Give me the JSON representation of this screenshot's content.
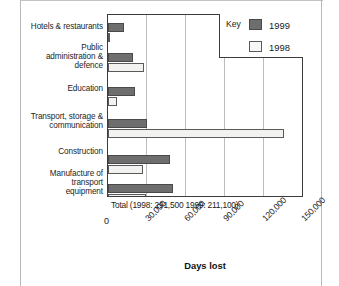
{
  "chart_data": {
    "type": "bar",
    "orientation": "horizontal",
    "title": "",
    "xlabel": "Days lost",
    "ylabel": "",
    "xlim": [
      0,
      150000
    ],
    "xticks": [
      0,
      30000,
      60000,
      90000,
      120000,
      150000
    ],
    "xtick_labels": [
      "0",
      "30,000",
      "60,000",
      "90,000",
      "120,000",
      "150,000"
    ],
    "grid": true,
    "legend_position": "top-right",
    "legend_title": "Key",
    "categories": [
      "Hotels & restaurants",
      "Public\nadministration &\ndefence",
      "Education",
      "Transport, storage &\ncommunication",
      "Construction",
      "Manufacture of\ntransport\nequipment"
    ],
    "series": [
      {
        "name": "1999",
        "color": "#6e6e6e",
        "values": [
          12000,
          19000,
          20500,
          30000,
          48000,
          50000
        ]
      },
      {
        "name": "1998",
        "color": "#f2f2f0",
        "values": [
          1000,
          28000,
          7000,
          136000,
          27000,
          29000
        ]
      }
    ],
    "annotation": "Total (1998: 291,500 1999: 211,100)",
    "totals": {
      "1998": "291,500",
      "1999": "211,100"
    }
  },
  "legend": {
    "title": "Key",
    "entries": [
      {
        "label": "1999",
        "swatch": "dark-gray-filled"
      },
      {
        "label": "1998",
        "swatch": "white-outlined"
      }
    ]
  },
  "axis": {
    "title": "Days lost",
    "tick_labels": [
      "0",
      "30,000",
      "60,000",
      "90,000",
      "120,000",
      "150,000"
    ]
  },
  "annotation": {
    "total_label": "Total (1998: 291,500 1999: 211,100)"
  },
  "categories": [
    {
      "label": "Hotels & restaurants"
    },
    {
      "label": "Public\nadministration &\ndefence"
    },
    {
      "label": "Education"
    },
    {
      "label": "Transport, storage &\ncommunication"
    },
    {
      "label": "Construction"
    },
    {
      "label": "Manufacture of\ntransport\nequipment"
    }
  ]
}
